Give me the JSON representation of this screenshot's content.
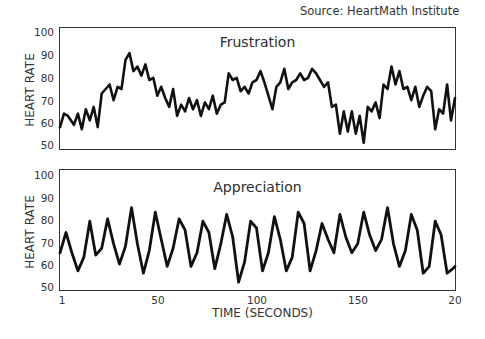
{
  "source": "Source: HeartMath Institute",
  "xaxis": {
    "title": "TIME (SECONDS)",
    "ticks": [
      {
        "label": "1",
        "x": 62
      },
      {
        "label": "50",
        "x": 158
      },
      {
        "label": "100",
        "x": 257
      },
      {
        "label": "150",
        "x": 358
      },
      {
        "label": "20",
        "x": 455
      }
    ]
  },
  "panels": [
    {
      "title": "Frustration",
      "ylabel": "HEART RATE",
      "yticks": [
        "100",
        "90",
        "80",
        "70",
        "60",
        "50"
      ]
    },
    {
      "title": "Appreciation",
      "ylabel": "HEART RATE",
      "yticks": [
        "100",
        "90",
        "80",
        "70",
        "60",
        "50"
      ]
    }
  ],
  "line_color": "#111111",
  "chart_data": [
    {
      "type": "line",
      "title": "Frustration",
      "xlabel": "TIME (SECONDS)",
      "ylabel": "HEART RATE",
      "ylim": [
        50,
        100
      ],
      "xlim": [
        1,
        200
      ],
      "grid": false,
      "x": [
        1,
        3,
        5,
        8,
        10,
        12,
        14,
        16,
        18,
        20,
        22,
        24,
        26,
        28,
        30,
        32,
        34,
        36,
        38,
        40,
        42,
        44,
        46,
        48,
        50,
        52,
        54,
        56,
        58,
        60,
        62,
        64,
        66,
        68,
        70,
        72,
        74,
        76,
        78,
        80,
        82,
        84,
        86,
        88,
        90,
        92,
        94,
        96,
        98,
        100,
        102,
        104,
        106,
        108,
        110,
        112,
        114,
        116,
        118,
        120,
        122,
        124,
        126,
        128,
        130,
        132,
        134,
        136,
        138,
        140,
        142,
        144,
        146,
        148,
        150,
        152,
        154,
        156,
        158,
        160,
        162,
        164,
        166,
        168,
        170,
        172,
        174,
        176,
        178,
        180,
        182,
        184,
        186,
        188,
        190,
        192,
        194,
        196,
        198,
        200
      ],
      "values": [
        58,
        64,
        63,
        59,
        64,
        57,
        66,
        61,
        67,
        58,
        73,
        75,
        77,
        70,
        76,
        75,
        88,
        91,
        83,
        85,
        81,
        86,
        79,
        80,
        72,
        76,
        71,
        67,
        75,
        63,
        68,
        65,
        71,
        66,
        70,
        63,
        69,
        66,
        72,
        64,
        68,
        69,
        82,
        79,
        80,
        74,
        76,
        73,
        78,
        79,
        83,
        78,
        72,
        66,
        76,
        78,
        84,
        75,
        78,
        79,
        82,
        79,
        80,
        84,
        82,
        79,
        76,
        78,
        67,
        68,
        55,
        65,
        56,
        65,
        55,
        63,
        51,
        67,
        65,
        69,
        62,
        77,
        75,
        85,
        77,
        83,
        75,
        76,
        70,
        76,
        67,
        72,
        76,
        74,
        57,
        66,
        64,
        77,
        61,
        71
      ],
      "series": [
        {
          "name": "Frustration",
          "values": "see values"
        }
      ]
    },
    {
      "type": "line",
      "title": "Appreciation",
      "xlabel": "TIME (SECONDS)",
      "ylabel": "HEART RATE",
      "ylim": [
        50,
        100
      ],
      "xlim": [
        1,
        200
      ],
      "grid": false,
      "x": [
        1,
        4,
        7,
        10,
        13,
        16,
        19,
        22,
        25,
        28,
        31,
        34,
        37,
        40,
        43,
        46,
        49,
        52,
        55,
        58,
        61,
        64,
        67,
        70,
        73,
        76,
        79,
        82,
        85,
        88,
        91,
        94,
        97,
        100,
        103,
        106,
        109,
        112,
        115,
        118,
        121,
        124,
        127,
        130,
        133,
        136,
        139,
        142,
        145,
        148,
        151,
        154,
        157,
        160,
        163,
        166,
        169,
        172,
        175,
        178,
        181,
        184,
        187,
        190,
        193,
        196,
        199,
        200
      ],
      "values": [
        66,
        75,
        66,
        58,
        64,
        80,
        65,
        68,
        81,
        70,
        61,
        69,
        86,
        70,
        57,
        67,
        84,
        72,
        60,
        68,
        81,
        76,
        60,
        66,
        80,
        75,
        59,
        70,
        83,
        73,
        53,
        62,
        80,
        77,
        58,
        66,
        82,
        72,
        58,
        64,
        84,
        79,
        58,
        67,
        79,
        72,
        66,
        83,
        73,
        66,
        70,
        84,
        74,
        67,
        72,
        86,
        70,
        60,
        67,
        83,
        76,
        57,
        60,
        80,
        74,
        57,
        59,
        60
      ]
    }
  ]
}
